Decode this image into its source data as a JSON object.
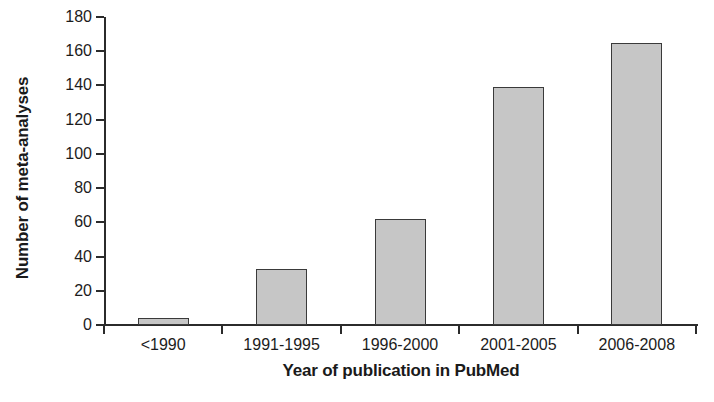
{
  "chart_data": {
    "type": "bar",
    "title": "",
    "categories": [
      "<1990",
      "1991-1995",
      "1996-2000",
      "2001-2005",
      "2006-2008"
    ],
    "values": [
      4,
      33,
      62,
      139,
      165
    ],
    "xlabel": "Year of publication in PubMed",
    "ylabel": "Number of meta-analyses",
    "ylim": [
      0,
      180
    ],
    "ytick_step": 20,
    "yticks": [
      0,
      20,
      40,
      60,
      80,
      100,
      120,
      140,
      160,
      180
    ],
    "ytick_labels": [
      "0",
      "20",
      "40",
      "60",
      "80",
      "100",
      "120",
      "140",
      "160",
      "180"
    ],
    "grid": false,
    "legend": null,
    "bar_fill_color": "#c6c6c6",
    "bar_edge_color": "#3a3a3a",
    "axis_color": "#2b2b2b",
    "background_color": "#ffffff"
  }
}
